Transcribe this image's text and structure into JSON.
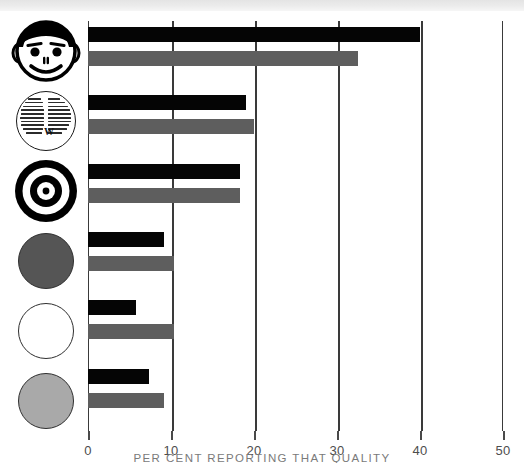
{
  "figure": {
    "background_color": "#ffffff",
    "top_band_color": "#e8e8e8",
    "axis_color": "#3a3a3a"
  },
  "axis": {
    "title": "PER CENT REPORTING THAT QUALITY",
    "tick_labels": [
      "0",
      "10",
      "20",
      "30",
      "40",
      "50"
    ]
  },
  "series_colors": {
    "black": "#050505",
    "gray": "#5e5e5e"
  },
  "icons": [
    {
      "name": "smiley-face-icon",
      "label": "smiley face"
    },
    {
      "name": "text-circle-icon",
      "label": "circle of text"
    },
    {
      "name": "bullseye-target-icon",
      "label": "bullseye target"
    },
    {
      "name": "dark-gray-circle-icon",
      "label": "dark gray circle"
    },
    {
      "name": "white-circle-icon",
      "label": "white circle"
    },
    {
      "name": "light-gray-circle-icon",
      "label": "light gray circle"
    }
  ],
  "chart_data": {
    "type": "bar",
    "orientation": "horizontal",
    "title": "",
    "xlabel": "PER CENT REPORTING THAT QUALITY",
    "ylabel": "",
    "xlim": [
      0,
      50
    ],
    "xticks": [
      0,
      10,
      20,
      30,
      40,
      50
    ],
    "grid": true,
    "grid_axis": "x",
    "legend": "none",
    "categories": [
      "smiley face",
      "circle of text",
      "bullseye target",
      "dark gray circle",
      "white circle",
      "light gray circle"
    ],
    "series": [
      {
        "name": "black",
        "color": "#050505",
        "values": [
          40.0,
          19.0,
          18.3,
          9.2,
          5.8,
          7.3
        ]
      },
      {
        "name": "gray",
        "color": "#5e5e5e",
        "values": [
          32.5,
          20.0,
          18.3,
          10.4,
          10.4,
          9.2
        ]
      }
    ]
  }
}
